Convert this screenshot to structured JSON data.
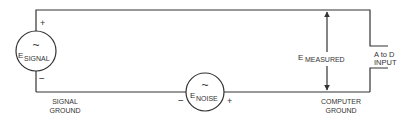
{
  "diagram": {
    "type": "circuit",
    "colors": {
      "line": "#333333",
      "background": "#ffffff"
    },
    "signal_source": {
      "symbol": "~",
      "label_main": "E",
      "label_sub": "SIGNAL",
      "plus": "+",
      "minus": "−"
    },
    "noise_source": {
      "symbol": "~",
      "label_main": "E",
      "label_sub": "NOISE",
      "plus": "+",
      "minus": "−"
    },
    "measured": {
      "label_main": "E",
      "label_sub": "MEASURED"
    },
    "adc": {
      "line1": "A to D",
      "line2": "INPUT"
    },
    "signal_ground": {
      "line1": "SIGNAL",
      "line2": "GROUND"
    },
    "computer_ground": {
      "line1": "COMPUTER",
      "line2": "GROUND"
    }
  }
}
